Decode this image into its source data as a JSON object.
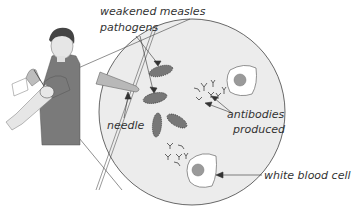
{
  "diagram": {
    "labels": {
      "pathogens_line1": "weakened measles",
      "pathogens_line2": "pathogens",
      "needle": "needle",
      "antibodies_line1": "antibodies",
      "antibodies_line2": "produced",
      "white_blood_cell": "white blood cell"
    },
    "colors": {
      "circle_fill": "#ececec",
      "pathogen_fill": "#777777",
      "shirt": "#7a7a7a",
      "skin": "#e4e4e4",
      "cell_nucleus": "#9a9a9a",
      "text": "#333333"
    }
  }
}
